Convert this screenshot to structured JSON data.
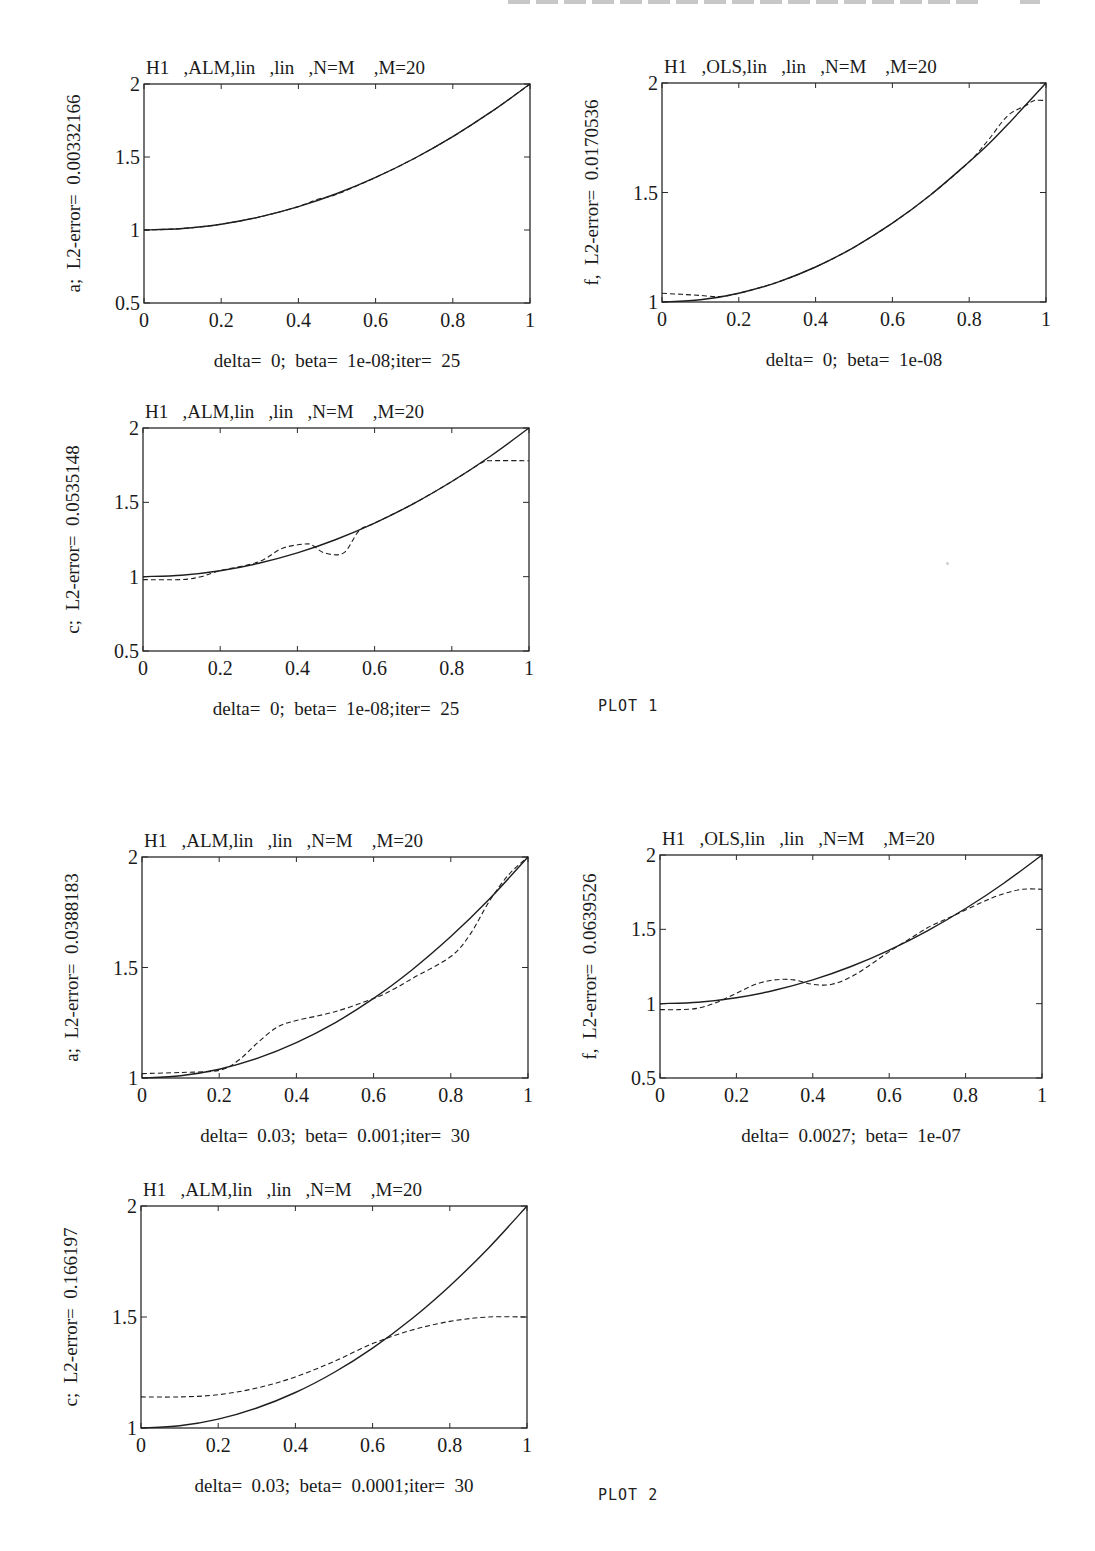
{
  "page": {
    "plot_labels": [
      {
        "text": "PLOT 1",
        "x": 598,
        "y": 697
      },
      {
        "text": "PLOT 2",
        "x": 598,
        "y": 1486
      }
    ]
  },
  "chart_data": [
    {
      "id": "plot1-a",
      "type": "line",
      "frame": {
        "left": 144,
        "top": 84,
        "right": 530,
        "bottom": 303
      },
      "title": "H1   ,ALM,lin   ,lin   ,N=M    ,M=20",
      "ylabel": "a;  L2-error=  0.00332166",
      "xlabel": "delta=  0;  beta=  1e-08;iter=  25",
      "xlim": [
        0,
        1
      ],
      "ylim": [
        0.5,
        2
      ],
      "xticks": [
        "0",
        "0.2",
        "0.4",
        "0.6",
        "0.8",
        "1"
      ],
      "yticks": [
        {
          "v": 0.5,
          "label": "0.5"
        },
        {
          "v": 1,
          "label": "1"
        },
        {
          "v": 1.5,
          "label": "1.5"
        },
        {
          "v": 2,
          "label": "2"
        }
      ],
      "series": [
        {
          "name": "exact",
          "style": "solid",
          "x": [
            0,
            0.1,
            0.2,
            0.3,
            0.4,
            0.5,
            0.6,
            0.7,
            0.8,
            0.9,
            1
          ],
          "y": [
            1,
            1.01,
            1.04,
            1.09,
            1.16,
            1.25,
            1.36,
            1.49,
            1.64,
            1.81,
            2
          ]
        },
        {
          "name": "reconstruction",
          "style": "dashed",
          "x": [
            0,
            0.1,
            0.2,
            0.3,
            0.4,
            0.45,
            0.5,
            0.6,
            0.7,
            0.8,
            0.9,
            1
          ],
          "y": [
            1,
            1.01,
            1.04,
            1.09,
            1.16,
            1.21,
            1.245,
            1.36,
            1.49,
            1.64,
            1.81,
            2
          ]
        }
      ]
    },
    {
      "id": "plot1-f",
      "type": "line",
      "frame": {
        "left": 662,
        "top": 83,
        "right": 1046,
        "bottom": 302
      },
      "title": "H1   ,OLS,lin   ,lin   ,N=M    ,M=20",
      "ylabel": "f,  L2-error=  0.0170536",
      "xlabel": "delta=  0;  beta=  1e-08",
      "xlim": [
        0,
        1
      ],
      "ylim": [
        1,
        2
      ],
      "xticks": [
        "0",
        "0.2",
        "0.4",
        "0.6",
        "0.8",
        "1"
      ],
      "yticks": [
        {
          "v": 1,
          "label": "1"
        },
        {
          "v": 1.5,
          "label": "1.5"
        },
        {
          "v": 2,
          "label": "2"
        }
      ],
      "series": [
        {
          "name": "exact",
          "style": "solid",
          "x": [
            0,
            0.1,
            0.2,
            0.3,
            0.4,
            0.5,
            0.6,
            0.7,
            0.8,
            0.85,
            0.9,
            1
          ],
          "y": [
            1,
            1.01,
            1.04,
            1.09,
            1.16,
            1.25,
            1.36,
            1.49,
            1.64,
            1.72,
            1.81,
            2
          ]
        },
        {
          "name": "reconstruction",
          "style": "dashed",
          "x": [
            0,
            0.05,
            0.1,
            0.15,
            0.2,
            0.3,
            0.4,
            0.5,
            0.6,
            0.7,
            0.8,
            0.85,
            0.9,
            0.95,
            0.97,
            1
          ],
          "y": [
            1.04,
            1.035,
            1.03,
            1.025,
            1.04,
            1.09,
            1.16,
            1.25,
            1.36,
            1.49,
            1.64,
            1.74,
            1.85,
            1.9,
            1.92,
            1.92
          ]
        }
      ]
    },
    {
      "id": "plot1-c",
      "type": "line",
      "frame": {
        "left": 143,
        "top": 428,
        "right": 529,
        "bottom": 651
      },
      "title": "H1   ,ALM,lin   ,lin   ,N=M    ,M=20",
      "ylabel": "c;  L2-error=  0.0535148",
      "xlabel": "delta=  0;  beta=  1e-08;iter=  25",
      "xlim": [
        0,
        1
      ],
      "ylim": [
        0.5,
        2
      ],
      "xticks": [
        "0",
        "0.2",
        "0.4",
        "0.6",
        "0.8",
        "1"
      ],
      "yticks": [
        {
          "v": 0.5,
          "label": "0.5"
        },
        {
          "v": 1,
          "label": "1"
        },
        {
          "v": 1.5,
          "label": "1.5"
        },
        {
          "v": 2,
          "label": "2"
        }
      ],
      "series": [
        {
          "name": "exact",
          "style": "solid",
          "x": [
            0,
            0.1,
            0.2,
            0.3,
            0.4,
            0.5,
            0.6,
            0.7,
            0.8,
            0.9,
            1
          ],
          "y": [
            1,
            1.01,
            1.04,
            1.09,
            1.16,
            1.25,
            1.36,
            1.49,
            1.64,
            1.81,
            2
          ]
        },
        {
          "name": "reconstruction",
          "style": "dashed",
          "x": [
            0,
            0.1,
            0.15,
            0.2,
            0.3,
            0.36,
            0.42,
            0.44,
            0.47,
            0.52,
            0.56,
            0.6,
            0.7,
            0.8,
            0.88,
            0.9,
            1
          ],
          "y": [
            0.98,
            0.98,
            1.0,
            1.04,
            1.1,
            1.19,
            1.22,
            1.21,
            1.16,
            1.16,
            1.31,
            1.36,
            1.49,
            1.64,
            1.77,
            1.78,
            1.78
          ]
        }
      ]
    },
    {
      "id": "plot2-a",
      "type": "line",
      "frame": {
        "left": 142,
        "top": 857,
        "right": 528,
        "bottom": 1078
      },
      "title": "H1   ,ALM,lin   ,lin   ,N=M    ,M=20",
      "ylabel": "a;  L2-error=  0.0388183",
      "xlabel": "delta=  0.03;  beta=  0.001;iter=  30",
      "xlim": [
        0,
        1
      ],
      "ylim": [
        1,
        2
      ],
      "xticks": [
        "0",
        "0.2",
        "0.4",
        "0.6",
        "0.8",
        "1"
      ],
      "yticks": [
        {
          "v": 1,
          "label": "1"
        },
        {
          "v": 1.5,
          "label": "1.5"
        },
        {
          "v": 2,
          "label": "2"
        }
      ],
      "series": [
        {
          "name": "exact",
          "style": "solid",
          "x": [
            0,
            0.1,
            0.2,
            0.3,
            0.4,
            0.5,
            0.6,
            0.7,
            0.8,
            0.9,
            1
          ],
          "y": [
            1,
            1.01,
            1.04,
            1.09,
            1.16,
            1.25,
            1.36,
            1.49,
            1.64,
            1.81,
            2
          ]
        },
        {
          "name": "reconstruction",
          "style": "dashed",
          "x": [
            0,
            0.1,
            0.2,
            0.25,
            0.3,
            0.35,
            0.4,
            0.5,
            0.6,
            0.65,
            0.7,
            0.8,
            0.85,
            0.9,
            0.95,
            1
          ],
          "y": [
            1.02,
            1.025,
            1.035,
            1.08,
            1.16,
            1.23,
            1.26,
            1.3,
            1.36,
            1.4,
            1.45,
            1.55,
            1.65,
            1.8,
            1.92,
            2.0
          ]
        }
      ]
    },
    {
      "id": "plot2-f",
      "type": "line",
      "frame": {
        "left": 660,
        "top": 855,
        "right": 1042,
        "bottom": 1078
      },
      "title": "H1   ,OLS,lin   ,lin   ,N=M    ,M=20",
      "ylabel": "f,  L2-error=  0.0639526",
      "xlabel": "delta=  0.0027;  beta=  1e-07",
      "xlim": [
        0,
        1
      ],
      "ylim": [
        0.5,
        2
      ],
      "xticks": [
        "0",
        "0.2",
        "0.4",
        "0.6",
        "0.8",
        "1"
      ],
      "yticks": [
        {
          "v": 0.5,
          "label": "0.5"
        },
        {
          "v": 1,
          "label": "1"
        },
        {
          "v": 1.5,
          "label": "1.5"
        },
        {
          "v": 2,
          "label": "2"
        }
      ],
      "series": [
        {
          "name": "exact",
          "style": "solid",
          "x": [
            0,
            0.1,
            0.2,
            0.3,
            0.4,
            0.5,
            0.6,
            0.7,
            0.8,
            0.9,
            1
          ],
          "y": [
            1,
            1.01,
            1.04,
            1.09,
            1.16,
            1.25,
            1.36,
            1.49,
            1.64,
            1.81,
            2
          ]
        },
        {
          "name": "reconstruction",
          "style": "dashed",
          "x": [
            0,
            0.05,
            0.1,
            0.15,
            0.2,
            0.25,
            0.3,
            0.35,
            0.4,
            0.45,
            0.5,
            0.55,
            0.6,
            0.65,
            0.7,
            0.75,
            0.8,
            0.85,
            0.9,
            0.95,
            1
          ],
          "y": [
            0.96,
            0.96,
            0.97,
            1.01,
            1.07,
            1.13,
            1.16,
            1.16,
            1.13,
            1.13,
            1.18,
            1.26,
            1.35,
            1.43,
            1.51,
            1.57,
            1.63,
            1.69,
            1.74,
            1.77,
            1.77
          ]
        }
      ]
    },
    {
      "id": "plot2-c",
      "type": "line",
      "frame": {
        "left": 141,
        "top": 1206,
        "right": 527,
        "bottom": 1428
      },
      "title": "H1   ,ALM,lin   ,lin   ,N=M    ,M=20",
      "ylabel": "c;  L2-error=  0.166197",
      "xlabel": "delta=  0.03;  beta=  0.0001;iter=  30",
      "xlim": [
        0,
        1
      ],
      "ylim": [
        1,
        2
      ],
      "xticks": [
        "0",
        "0.2",
        "0.4",
        "0.6",
        "0.8",
        "1"
      ],
      "yticks": [
        {
          "v": 1,
          "label": "1"
        },
        {
          "v": 1.5,
          "label": "1.5"
        },
        {
          "v": 2,
          "label": "2"
        }
      ],
      "series": [
        {
          "name": "exact",
          "style": "solid",
          "x": [
            0,
            0.1,
            0.2,
            0.3,
            0.4,
            0.5,
            0.6,
            0.7,
            0.8,
            0.9,
            1
          ],
          "y": [
            1,
            1.01,
            1.04,
            1.09,
            1.16,
            1.25,
            1.36,
            1.49,
            1.64,
            1.81,
            2
          ]
        },
        {
          "name": "reconstruction",
          "style": "dashed",
          "x": [
            0,
            0.1,
            0.2,
            0.3,
            0.4,
            0.5,
            0.6,
            0.7,
            0.8,
            0.9,
            1
          ],
          "y": [
            1.14,
            1.14,
            1.15,
            1.18,
            1.23,
            1.3,
            1.38,
            1.44,
            1.48,
            1.5,
            1.5
          ]
        }
      ]
    }
  ]
}
